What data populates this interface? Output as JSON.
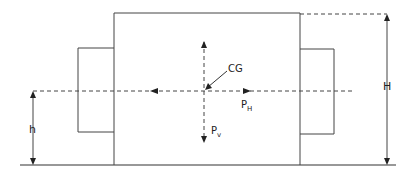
{
  "diagram": {
    "type": "force-diagram",
    "colors": {
      "line": "#333333",
      "background": "#ffffff"
    },
    "labels": {
      "cg": "CG",
      "ph_main": "P",
      "ph_sub": "H",
      "pv_main": "P",
      "pv_sub": "v",
      "height_total": "H",
      "height_cg": "h"
    },
    "elements": {
      "main_body": {
        "x": 114,
        "y": 13,
        "width": 186,
        "height": 152
      },
      "left_block": {
        "x": 78,
        "y": 48,
        "width": 36,
        "height": 84
      },
      "right_block": {
        "x": 300,
        "y": 49,
        "width": 34,
        "height": 85
      },
      "ground_line_y": 165,
      "cg_point": {
        "x": 204,
        "y": 91
      }
    }
  }
}
